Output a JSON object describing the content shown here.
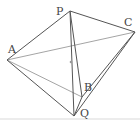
{
  "diagram": {
    "title": "",
    "points": {
      "A": {
        "label": "A",
        "x": 7,
        "y": 60
      },
      "P": {
        "label": "P",
        "x": 70,
        "y": 11
      },
      "C": {
        "label": "C",
        "x": 135,
        "y": 32
      },
      "B": {
        "label": "B",
        "x": 82,
        "y": 97
      },
      "Q": {
        "label": "Q",
        "x": 74,
        "y": 116
      },
      "O": {
        "label": "",
        "x": 71,
        "y": 62
      }
    },
    "edges": [
      [
        "A",
        "P"
      ],
      [
        "P",
        "C"
      ],
      [
        "A",
        "C"
      ],
      [
        "A",
        "B"
      ],
      [
        "A",
        "Q"
      ],
      [
        "P",
        "B"
      ],
      [
        "P",
        "Q"
      ],
      [
        "C",
        "B"
      ],
      [
        "C",
        "Q"
      ],
      [
        "B",
        "Q"
      ]
    ],
    "colors": {
      "dark_line": "#555555",
      "light_line": "#aaaaaa",
      "label": "#444444",
      "baseline": "#e4e4e4"
    }
  }
}
